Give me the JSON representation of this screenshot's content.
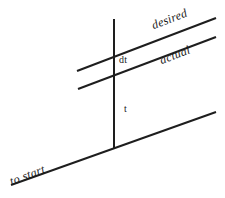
{
  "diagram": {
    "canvas": {
      "width": 225,
      "height": 198,
      "background_color": "#ffffff"
    },
    "stroke_color": "#1e1e1e",
    "stroke_width": 2,
    "lines": [
      {
        "name": "desired-line",
        "x1": 77,
        "y1": 71,
        "x2": 216,
        "y2": 18
      },
      {
        "name": "actual-line",
        "x1": 78,
        "y1": 89,
        "x2": 216,
        "y2": 37
      },
      {
        "name": "to-start-line",
        "x1": 11,
        "y1": 185,
        "x2": 216,
        "y2": 112
      },
      {
        "name": "vertical-time-axis",
        "x1": 114,
        "y1": 19,
        "x2": 114,
        "y2": 149
      }
    ],
    "labels": {
      "desired": "desired",
      "actual": "actual",
      "dt": "dt",
      "t": "t",
      "to_start": "to start"
    }
  }
}
